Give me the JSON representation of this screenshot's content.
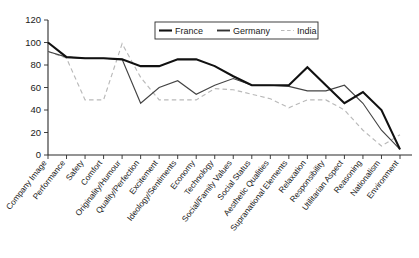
{
  "chart_data": {
    "type": "line",
    "title": "",
    "xlabel": "",
    "ylabel": "",
    "ylim": [
      0,
      120
    ],
    "yticks": [
      0,
      20,
      40,
      60,
      80,
      100,
      120
    ],
    "grid": false,
    "legend_position": "top-right",
    "categories": [
      "Company Image",
      "Performance",
      "Safety",
      "Comfort",
      "Originality/Humour",
      "Quality/Perfection",
      "Excitement",
      "Ideology/Sentiments",
      "Economy",
      "Technology",
      "Social/Family Values",
      "Social Status",
      "Aesthetic Qualities",
      "Supranational Elements",
      "Relaxation",
      "Responsibility",
      "Utilitarian Aspect",
      "Reasoning",
      "Nationalism",
      "Environment"
    ],
    "series": [
      {
        "name": "France",
        "color": "#111111",
        "style": "solid",
        "width": "thick",
        "values": [
          100,
          87,
          86,
          86,
          85,
          79,
          79,
          85,
          85,
          79,
          70,
          62,
          62,
          62,
          78,
          62,
          46,
          56,
          40,
          5
        ]
      },
      {
        "name": "Germany",
        "color": "#444444",
        "style": "solid",
        "width": "thin",
        "values": [
          92,
          87,
          86,
          86,
          85,
          46,
          60,
          66,
          54,
          62,
          68,
          62,
          62,
          61,
          57,
          57,
          62,
          46,
          22,
          5
        ]
      },
      {
        "name": "India",
        "color": "#b9b9b9",
        "style": "dashed",
        "width": "thin",
        "values": [
          92,
          86,
          49,
          49,
          99,
          69,
          49,
          49,
          49,
          59,
          58,
          54,
          50,
          42,
          49,
          49,
          40,
          22,
          8,
          18
        ]
      }
    ]
  },
  "legend": {
    "entries": [
      {
        "label": "France"
      },
      {
        "label": "Germany"
      },
      {
        "label": "India"
      }
    ]
  }
}
